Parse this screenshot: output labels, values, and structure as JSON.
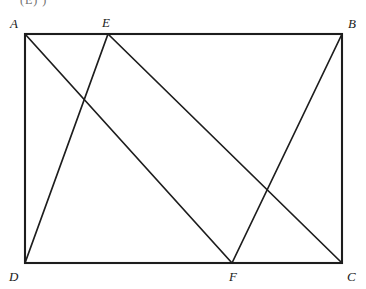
{
  "figure": {
    "caption_fragment": "(E)     )",
    "stroke_color": "#1d1d1d",
    "background_color": "#ffffff",
    "label_color": "#1a1a1a",
    "vertices": [
      {
        "id": "A",
        "label": "A",
        "x": 25,
        "y": 34,
        "label_x": 10,
        "label_y": 17
      },
      {
        "id": "E",
        "label": "E",
        "x": 108,
        "y": 34,
        "label_x": 102,
        "label_y": 16
      },
      {
        "id": "B",
        "label": "B",
        "x": 342,
        "y": 34,
        "label_x": 348,
        "label_y": 17
      },
      {
        "id": "D",
        "label": "D",
        "x": 25,
        "y": 263,
        "label_x": 9,
        "label_y": 270
      },
      {
        "id": "F",
        "label": "F",
        "x": 232,
        "y": 263,
        "label_x": 229,
        "label_y": 270
      },
      {
        "id": "C",
        "label": "C",
        "x": 342,
        "y": 263,
        "label_x": 347,
        "label_y": 270
      }
    ],
    "rectangle": {
      "name": "ABCD",
      "x": 25,
      "y": 34,
      "width": 317,
      "height": 229,
      "stroke_width": 2.1
    },
    "segments": [
      {
        "name": "A-F",
        "from": "A",
        "to": "F",
        "x1": 25,
        "y1": 34,
        "x2": 232,
        "y2": 263,
        "stroke_width": 1.7
      },
      {
        "name": "D-E",
        "from": "D",
        "to": "E",
        "x1": 25,
        "y1": 263,
        "x2": 108,
        "y2": 34,
        "stroke_width": 1.7
      },
      {
        "name": "E-C",
        "from": "E",
        "to": "C",
        "x1": 108,
        "y1": 34,
        "x2": 342,
        "y2": 263,
        "stroke_width": 1.7
      },
      {
        "name": "F-B",
        "from": "F",
        "to": "B",
        "x1": 232,
        "y1": 263,
        "x2": 342,
        "y2": 34,
        "stroke_width": 1.7
      }
    ]
  },
  "chart_data": {
    "type": "diagram",
    "shape": "rectangle",
    "points": {
      "A": [
        25,
        34
      ],
      "B": [
        342,
        34
      ],
      "C": [
        342,
        263
      ],
      "D": [
        25,
        263
      ],
      "E": [
        108,
        34
      ],
      "F": [
        232,
        263
      ]
    },
    "edges": [
      "AB",
      "BC",
      "CD",
      "DA"
    ],
    "interior_segments": [
      "AF",
      "DE",
      "EC",
      "FB"
    ],
    "intersections": [
      {
        "segments": [
          "AF",
          "DE"
        ],
        "approx_xy": [
          85,
          100
        ]
      },
      {
        "segments": [
          "EC",
          "FB"
        ],
        "approx_xy": [
          265,
          198
        ]
      }
    ]
  }
}
